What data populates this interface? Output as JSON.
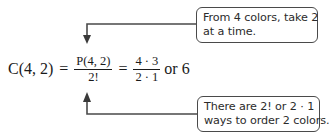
{
  "formula": {
    "lhs": "C(4, 2)",
    "equals_1": "=",
    "fraction_1": {
      "numerator": "P(4, 2)",
      "denominator": "2!"
    },
    "equals_2": "=",
    "fraction_2": {
      "numerator": "4 · 3",
      "denominator": "2 · 1"
    },
    "conjunction": "or",
    "result": "6"
  },
  "callouts": {
    "top": {
      "lines": [
        "From 4 colors, take 2",
        "at a time."
      ],
      "points_to": "P(4, 2)"
    },
    "bottom": {
      "lines": [
        "There are 2! or 2  · 1",
        "ways to order 2 colors."
      ],
      "points_to": "2!"
    }
  },
  "colors": {
    "stroke": "#4a4a4a",
    "text": "#2b2b2b",
    "background": "#ffffff"
  }
}
